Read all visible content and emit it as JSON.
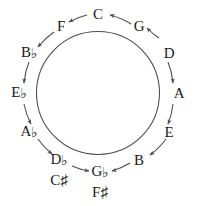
{
  "diagram": {
    "shape": "circle",
    "stroke_color": "#4a4a4a",
    "text_color": "#1a1a1a",
    "background": "#ffffff",
    "center": {
      "x": 98,
      "y": 93
    },
    "radius": 62,
    "arrow_direction": "counterclockwise",
    "notes": [
      {
        "name": "C",
        "letter": "C",
        "accidental": "",
        "angle_deg": -90,
        "x": 98,
        "y": 14,
        "label_radius": 79
      },
      {
        "name": "G",
        "letter": "G",
        "accidental": "",
        "angle_deg": -60,
        "x": 139,
        "y": 26,
        "label_radius": 79
      },
      {
        "name": "D",
        "letter": "D",
        "accidental": "",
        "angle_deg": -30,
        "x": 169,
        "y": 53,
        "label_radius": 79
      },
      {
        "name": "A",
        "letter": "A",
        "accidental": "",
        "angle_deg": 0,
        "x": 179,
        "y": 93,
        "label_radius": 79
      },
      {
        "name": "E",
        "letter": "E",
        "accidental": "",
        "angle_deg": 30,
        "x": 169,
        "y": 132,
        "label_radius": 79
      },
      {
        "name": "B",
        "letter": "B",
        "accidental": "",
        "angle_deg": 60,
        "x": 139,
        "y": 160,
        "label_radius": 79
      },
      {
        "name": "Gb",
        "letter": "G",
        "accidental": "b",
        "angle_deg": 90,
        "x": 100,
        "y": 172,
        "label_radius": 79
      },
      {
        "name": "Db",
        "letter": "D",
        "accidental": "b",
        "angle_deg": 120,
        "x": 59,
        "y": 160,
        "label_radius": 79
      },
      {
        "name": "Ab",
        "letter": "A",
        "accidental": "b",
        "angle_deg": 150,
        "x": 29,
        "y": 132,
        "label_radius": 79
      },
      {
        "name": "Eb",
        "letter": "E",
        "accidental": "b",
        "angle_deg": 180,
        "x": 19,
        "y": 93,
        "label_radius": 79
      },
      {
        "name": "Bb",
        "letter": "B",
        "accidental": "b",
        "angle_deg": -150,
        "x": 29,
        "y": 53,
        "label_radius": 79
      },
      {
        "name": "F",
        "letter": "F",
        "accidental": "",
        "angle_deg": -120,
        "x": 61,
        "y": 26,
        "label_radius": 79
      }
    ],
    "enharmonics": [
      {
        "name": "C#",
        "letter": "C",
        "accidental": "#",
        "under": "Db",
        "x": 59,
        "y": 180
      },
      {
        "name": "F#",
        "letter": "F",
        "accidental": "#",
        "under": "Gb",
        "x": 100,
        "y": 192
      }
    ],
    "accidental_glyphs": {
      "flat": "♭",
      "sharp": "♯"
    }
  }
}
